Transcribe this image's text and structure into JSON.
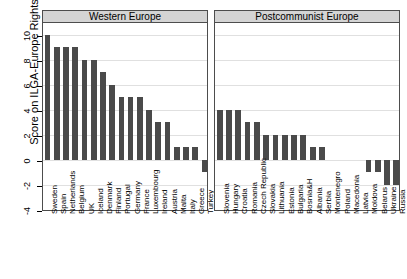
{
  "chart_data": {
    "type": "bar",
    "title": "",
    "xlabel": "",
    "ylabel": "Score on ILGA-Europe Rights Index",
    "ylim": [
      -4,
      11
    ],
    "yticks": [
      10,
      8,
      6,
      4,
      2,
      0,
      -2,
      -4
    ],
    "ytick_labels": [
      "10",
      "8",
      "6",
      "4",
      "2",
      "0",
      "-2",
      "-4"
    ],
    "grid": true,
    "legend": "none",
    "orientation": "vertical",
    "bar_color": "#4a4a4a",
    "panels": [
      {
        "label": "Western Europe",
        "categories": [
          "Sweden",
          "Spain",
          "Netherlands",
          "Belgium",
          "UK",
          "Iceland",
          "Denmark",
          "Finland",
          "Portugal",
          "Germany",
          "France",
          "Luxembourg",
          "Ireland",
          "Austria",
          "Malta",
          "Italy",
          "Greece",
          "Turkey"
        ],
        "values": [
          10,
          9,
          9,
          9,
          8,
          8,
          7,
          6,
          5,
          5,
          5,
          4,
          3,
          3,
          1,
          1,
          1,
          -1
        ]
      },
      {
        "label": "Postcommunist Europe",
        "categories": [
          "Slovenia",
          "Hungary",
          "Croatia",
          "Romania",
          "Czech Republic",
          "Slovakia",
          "Lithuania",
          "Estonia",
          "Bulgaria",
          "Bosnia&H",
          "Albania",
          "Serbia",
          "Montenegro",
          "Poland",
          "Macedonia",
          "Latvia",
          "Moldova",
          "Belarus",
          "Ukraine",
          "Russia"
        ],
        "values": [
          4,
          4,
          4,
          3,
          3,
          2,
          2,
          2,
          2,
          2,
          1,
          1,
          0,
          0,
          0,
          0,
          -1,
          -1,
          -2,
          -2
        ]
      }
    ]
  }
}
